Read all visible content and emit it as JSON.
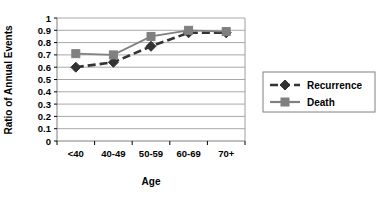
{
  "chart_data": {
    "type": "line",
    "title": "",
    "xlabel": "Age",
    "ylabel": "Ratio of Annual Events",
    "categories": [
      "<40",
      "40-49",
      "50-59",
      "60-69",
      "70+"
    ],
    "ylim": [
      0,
      1
    ],
    "ytick_labels": [
      "0",
      "0.1",
      "0.2",
      "0.3",
      "0.4",
      "0.5",
      "0.6",
      "0.7",
      "0.8",
      "0.9",
      "1"
    ],
    "ytick_values": [
      0,
      0.1,
      0.2,
      0.3,
      0.4,
      0.5,
      0.6,
      0.7,
      0.8,
      0.9,
      1
    ],
    "grid": true,
    "legend_position": "right",
    "series": [
      {
        "name": "Recurrence",
        "values": [
          0.6,
          0.64,
          0.77,
          0.88,
          0.88
        ],
        "color": "#333333",
        "marker": "diamond",
        "line_style": "dashed"
      },
      {
        "name": "Death",
        "values": [
          0.71,
          0.7,
          0.85,
          0.9,
          0.89
        ],
        "color": "#808080",
        "marker": "square",
        "line_style": "solid"
      }
    ]
  },
  "legend": {
    "entries": [
      {
        "label": "Recurrence"
      },
      {
        "label": "Death"
      }
    ]
  },
  "axes": {
    "x_title": "Age",
    "y_title": "Ratio of Annual Events"
  }
}
